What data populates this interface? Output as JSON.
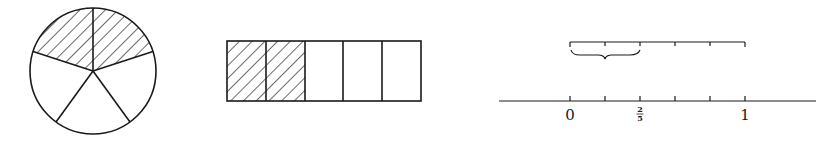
{
  "figure": {
    "ink_color": "#1a1a1a",
    "background": "#ffffff"
  },
  "pie": {
    "parts": 5,
    "shaded": 2,
    "shading": "diagonal-hatch"
  },
  "bar": {
    "parts": 5,
    "shaded": 2,
    "shading": "diagonal-hatch"
  },
  "number_line": {
    "labels": {
      "zero": "0",
      "two_fifths_num": "2",
      "two_fifths_den": "5",
      "one": "1"
    },
    "divisions": 5,
    "brace_span_parts": 2
  }
}
